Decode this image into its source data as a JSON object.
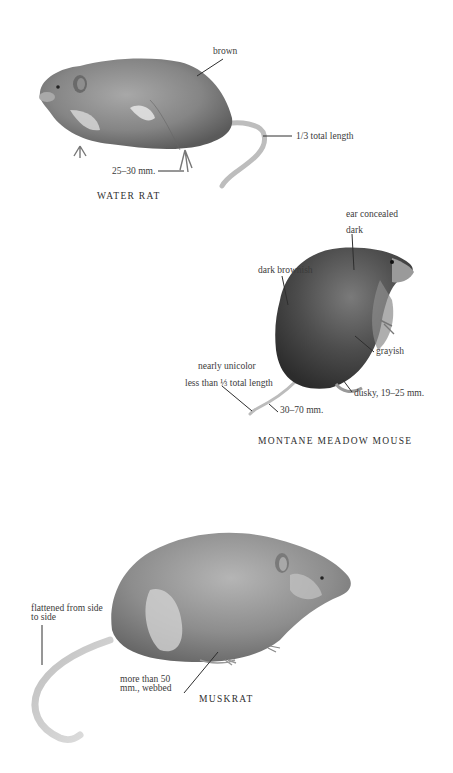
{
  "plates": [
    {
      "name": "water-rat",
      "caption": "WATER RAT",
      "labels": {
        "fur": "brown",
        "tail": "1/3 total length",
        "hind_foot": "25–30 mm."
      }
    },
    {
      "name": "montane-meadow-mouse",
      "caption": "MONTANE MEADOW MOUSE",
      "labels": {
        "ear": "ear concealed",
        "head": "dark",
        "back": "dark brownish",
        "belly": "grayish",
        "tail_color": "nearly unicolor",
        "tail_length": "less than ⅓ total length",
        "tail_mm": "30–70 mm.",
        "hind_foot": "dusky, 19–25 mm."
      }
    },
    {
      "name": "muskrat",
      "caption": "MUSKRAT",
      "labels": {
        "tail": "flattened from side to side",
        "hind_foot": "more than 50 mm., webbed"
      }
    }
  ],
  "colors": {
    "ink": "#3a3a3a",
    "fur_dark": "#4a4a4a",
    "fur_mid": "#8a8a8a",
    "fur_light": "#c8c8c8",
    "paper": "#ffffff"
  }
}
